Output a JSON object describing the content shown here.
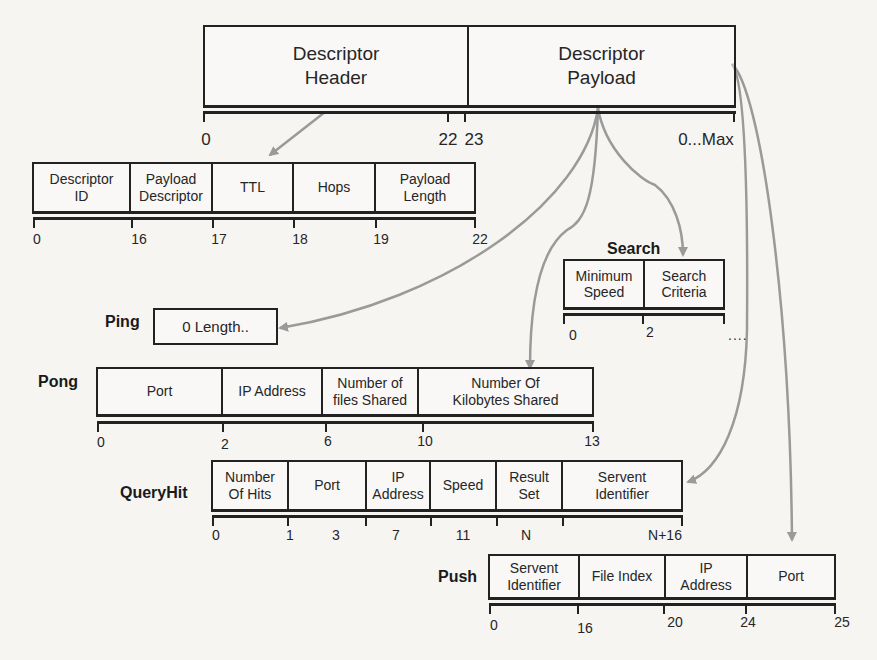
{
  "top": {
    "fields": [
      {
        "label": "Descriptor\nHeader"
      },
      {
        "label": "Descriptor\nPayload"
      }
    ],
    "offsets": [
      "0",
      "22",
      "23",
      "0...Max"
    ]
  },
  "header": {
    "fields": [
      {
        "label": "Descriptor\nID"
      },
      {
        "label": "Payload\nDescriptor"
      },
      {
        "label": "TTL"
      },
      {
        "label": "Hops"
      },
      {
        "label": "Payload\nLength"
      }
    ],
    "offsets": [
      "0",
      "16",
      "17",
      "18",
      "19",
      "22"
    ]
  },
  "search": {
    "title": "Search",
    "fields": [
      {
        "label": "Minimum\nSpeed"
      },
      {
        "label": "Search\nCriteria"
      }
    ],
    "offsets": [
      "0",
      "2"
    ],
    "continuation": "...."
  },
  "ping": {
    "title": "Ping",
    "fields": [
      {
        "label": "0 Length.."
      }
    ]
  },
  "pong": {
    "title": "Pong",
    "fields": [
      {
        "label": "Port"
      },
      {
        "label": "IP Address"
      },
      {
        "label": "Number of\nfiles Shared"
      },
      {
        "label": "Number Of\nKilobytes Shared"
      }
    ],
    "offsets": [
      "0",
      "2",
      "6",
      "10",
      "13"
    ]
  },
  "queryhit": {
    "title": "QueryHit",
    "fields": [
      {
        "label": "Number\nOf Hits"
      },
      {
        "label": "Port"
      },
      {
        "label": "IP\nAddress"
      },
      {
        "label": "Speed"
      },
      {
        "label": "Result\nSet"
      },
      {
        "label": "Servent\nIdentifier"
      }
    ],
    "offsets": [
      "0",
      "1",
      "3",
      "7",
      "11",
      "N",
      "N+16"
    ]
  },
  "push": {
    "title": "Push",
    "fields": [
      {
        "label": "Servent\nIdentifier"
      },
      {
        "label": "File Index"
      },
      {
        "label": "IP\nAddress"
      },
      {
        "label": "Port"
      }
    ],
    "offsets": [
      "0",
      "16",
      "20",
      "24",
      "25"
    ]
  },
  "colors": {
    "line": "#222222",
    "arrow": "#9a9a9a",
    "background": "#f6f5f2"
  }
}
